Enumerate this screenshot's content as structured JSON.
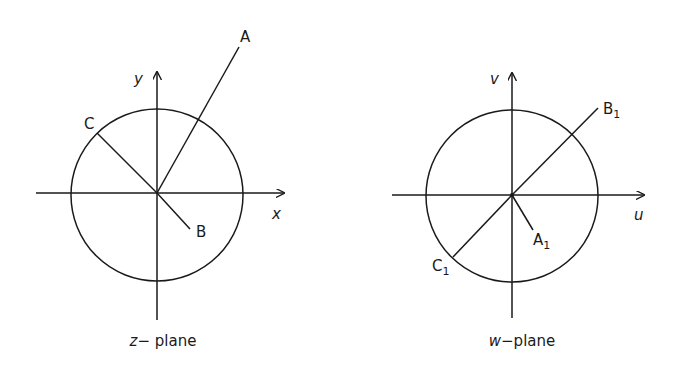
{
  "figure": {
    "panels": [
      {
        "id": "z-plane",
        "caption_var": "z",
        "caption_rest": "− plane",
        "axes": {
          "x_label": "x",
          "y_label": "y"
        },
        "circle": "unit circle",
        "points": [
          {
            "label": "A",
            "subscript": "",
            "position": "outside circle, first quadrant"
          },
          {
            "label": "B",
            "subscript": "",
            "position": "inside circle, fourth quadrant"
          },
          {
            "label": "C",
            "subscript": "",
            "position": "on circle, second quadrant"
          }
        ]
      },
      {
        "id": "w-plane",
        "caption_var": "w",
        "caption_rest": "−plane",
        "axes": {
          "x_label": "u",
          "y_label": "v"
        },
        "circle": "unit circle",
        "points": [
          {
            "label": "A",
            "subscript": "1",
            "position": "inside circle, fourth quadrant"
          },
          {
            "label": "B",
            "subscript": "1",
            "position": "outside circle, first quadrant"
          },
          {
            "label": "C",
            "subscript": "1",
            "position": "on circle, third quadrant"
          }
        ]
      }
    ]
  },
  "colors": {
    "ink": "#1a1a1a",
    "background": "#ffffff"
  }
}
